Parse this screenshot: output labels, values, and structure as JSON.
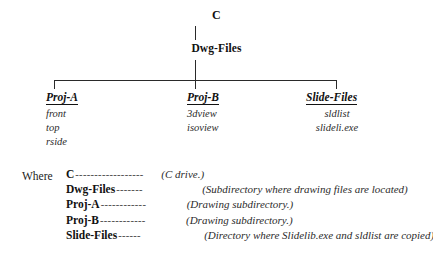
{
  "diagram": {
    "type": "directory-tree",
    "root": {
      "label": "C"
    },
    "level2": {
      "label": "Dwg-Files"
    },
    "branches": [
      {
        "label": "Proj-A",
        "align": "left",
        "files": [
          "front",
          "top",
          "rside"
        ]
      },
      {
        "label": "Proj-B",
        "align": "left",
        "files": [
          "3dview",
          "isoview"
        ]
      },
      {
        "label": "Slide-Files",
        "align": "center",
        "files": [
          "sldlist",
          "slideli.exe"
        ]
      }
    ]
  },
  "legend": {
    "where_label": "Where",
    "dash": "--------------------------------",
    "rows": [
      {
        "term": "C",
        "dashes": "------------------",
        "desc": "(C drive.)"
      },
      {
        "term": "Dwg-Files",
        "dashes": "-------",
        "desc": "(Subdirectory where drawing files are located)"
      },
      {
        "term": "Proj-A",
        "dashes": "------------",
        "desc": "(Drawing subdirectory.)"
      },
      {
        "term": "Proj-B",
        "dashes": "------------",
        "desc": "(Drawing subdirectory.)"
      },
      {
        "term": "Slide-Files",
        "dashes": "------",
        "desc": "(Directory where Slidelib.exe and sldlist are copied)"
      }
    ]
  },
  "colors": {
    "background": "#ffffff",
    "text": "#111111",
    "line": "#2a2a2a"
  }
}
